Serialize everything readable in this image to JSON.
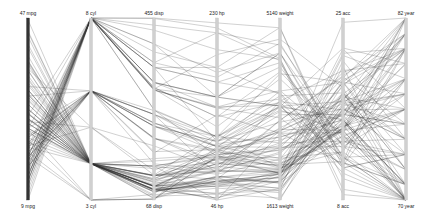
{
  "chart_data": {
    "type": "parallel_coordinates",
    "title": "",
    "axes": [
      {
        "name": "mpg",
        "max": 47,
        "min": 9,
        "top_label": "47 mpg",
        "bottom_label": "9 mpg",
        "x": 28,
        "style": "dark"
      },
      {
        "name": "cyl",
        "max": 8,
        "min": 3,
        "top_label": "8 cyl",
        "bottom_label": "3 cyl",
        "x": 91,
        "style": "light"
      },
      {
        "name": "disp",
        "max": 455,
        "min": 68,
        "top_label": "455 disp",
        "bottom_label": "68 disp",
        "x": 154,
        "style": "light"
      },
      {
        "name": "hp",
        "max": 230,
        "min": 46,
        "top_label": "230 hp",
        "bottom_label": "46 hp",
        "x": 217,
        "style": "light"
      },
      {
        "name": "weight",
        "max": 5140,
        "min": 1613,
        "top_label": "5140 weight",
        "bottom_label": "1613 weight",
        "x": 280,
        "style": "light"
      },
      {
        "name": "acc",
        "max": 25,
        "min": 8,
        "top_label": "25 acc",
        "bottom_label": "8 acc",
        "x": 343,
        "style": "light"
      },
      {
        "name": "year",
        "max": 82,
        "min": 70,
        "top_label": "82 year",
        "bottom_label": "70 year",
        "x": 406,
        "style": "light"
      }
    ],
    "plot_area": {
      "top": 18,
      "bottom": 200
    },
    "colors": {
      "line": "#333333",
      "axis_dark": "#333333",
      "axis_light": "#d0d0d0",
      "background": "#ffffff"
    },
    "records": [
      [
        18,
        8,
        307,
        130,
        3504,
        12,
        70
      ],
      [
        15,
        8,
        350,
        165,
        3693,
        11.5,
        70
      ],
      [
        18,
        8,
        318,
        150,
        3436,
        11,
        70
      ],
      [
        16,
        8,
        304,
        150,
        3433,
        12,
        70
      ],
      [
        17,
        8,
        302,
        140,
        3449,
        10.5,
        70
      ],
      [
        15,
        8,
        429,
        198,
        4341,
        10,
        70
      ],
      [
        14,
        8,
        454,
        220,
        4354,
        9,
        70
      ],
      [
        14,
        8,
        440,
        215,
        4312,
        8.5,
        70
      ],
      [
        24,
        4,
        113,
        95,
        2372,
        15,
        70
      ],
      [
        22,
        6,
        198,
        95,
        2833,
        15.5,
        70
      ],
      [
        18,
        6,
        199,
        97,
        2774,
        15.5,
        70
      ],
      [
        21,
        6,
        200,
        85,
        2587,
        16,
        70
      ],
      [
        27,
        4,
        97,
        88,
        2130,
        14.5,
        70
      ],
      [
        26,
        4,
        97,
        46,
        1835,
        20.5,
        70
      ],
      [
        25,
        4,
        110,
        87,
        2672,
        17.5,
        70
      ],
      [
        24,
        4,
        107,
        90,
        2430,
        14.5,
        70
      ],
      [
        28,
        4,
        140,
        90,
        2264,
        15.5,
        71
      ],
      [
        25,
        4,
        113,
        95,
        2228,
        14,
        71
      ],
      [
        19,
        6,
        232,
        100,
        2634,
        13,
        71
      ],
      [
        16,
        6,
        225,
        105,
        3439,
        15.5,
        71
      ],
      [
        17,
        6,
        250,
        100,
        3329,
        15.5,
        71
      ],
      [
        14,
        8,
        400,
        175,
        4464,
        11.5,
        71
      ],
      [
        13,
        8,
        350,
        165,
        4274,
        12,
        71
      ],
      [
        27,
        4,
        101,
        83,
        2202,
        15.3,
        71
      ],
      [
        22,
        4,
        140,
        72,
        2408,
        19,
        72
      ],
      [
        21,
        4,
        120,
        76,
        2511,
        18,
        72
      ],
      [
        12,
        8,
        455,
        225,
        4951,
        11,
        73
      ],
      [
        13,
        8,
        360,
        170,
        4654,
        13,
        73
      ],
      [
        20,
        4,
        97,
        88,
        2279,
        19,
        73
      ],
      [
        26,
        4,
        96,
        69,
        2189,
        18,
        72
      ],
      [
        16,
        6,
        258,
        110,
        3632,
        18,
        74
      ],
      [
        29,
        4,
        98,
        83,
        2219,
        16.5,
        74
      ],
      [
        32,
        4,
        71,
        65,
        1836,
        21,
        74
      ],
      [
        31,
        4,
        76,
        52,
        1649,
        16.5,
        74
      ],
      [
        19,
        6,
        225,
        95,
        3264,
        16,
        75
      ],
      [
        18,
        6,
        171,
        97,
        2984,
        14.5,
        75
      ],
      [
        29,
        4,
        90,
        70,
        1937,
        14,
        76
      ],
      [
        24,
        4,
        98,
        60,
        2164,
        22.1,
        76
      ],
      [
        15.5,
        8,
        304,
        120,
        3962,
        13.9,
        76
      ],
      [
        30,
        4,
        111,
        80,
        2155,
        14.8,
        77
      ],
      [
        20.5,
        6,
        225,
        100,
        3430,
        17.2,
        78
      ],
      [
        19.4,
        8,
        318,
        140,
        3735,
        13.2,
        78
      ],
      [
        30.5,
        4,
        98,
        63,
        2051,
        17,
        77
      ],
      [
        43.1,
        4,
        90,
        48,
        1985,
        21.5,
        78
      ],
      [
        36.1,
        4,
        91,
        60,
        1800,
        16.4,
        78
      ],
      [
        18.1,
        8,
        302,
        139,
        3205,
        11.2,
        78
      ],
      [
        20.2,
        8,
        302,
        139,
        3570,
        12.8,
        78
      ],
      [
        17.5,
        6,
        250,
        110,
        3520,
        16.4,
        77
      ],
      [
        27.2,
        4,
        119,
        97,
        2300,
        14.7,
        78
      ],
      [
        25.4,
        5,
        183,
        77,
        3530,
        20.1,
        79
      ],
      [
        37.3,
        4,
        91,
        69,
        2130,
        14.7,
        79
      ],
      [
        20.3,
        5,
        131,
        103,
        2830,
        15.9,
        78
      ],
      [
        23.9,
        8,
        260,
        90,
        3420,
        22.2,
        79
      ],
      [
        34.1,
        4,
        86,
        65,
        1975,
        15.2,
        79
      ],
      [
        46.6,
        4,
        86,
        65,
        2110,
        17.9,
        80
      ],
      [
        44.3,
        4,
        90,
        48,
        2085,
        21.7,
        80
      ],
      [
        32.7,
        6,
        168,
        132,
        2910,
        11.4,
        80
      ],
      [
        36.4,
        5,
        121,
        67,
        2950,
        19.9,
        80
      ],
      [
        29.8,
        4,
        89,
        62,
        1845,
        15.3,
        80
      ],
      [
        23.6,
        4,
        140,
        0,
        2905,
        14.3,
        80
      ],
      [
        31.3,
        4,
        120,
        75,
        2542,
        17.5,
        80
      ],
      [
        38.1,
        4,
        89,
        60,
        1968,
        18.8,
        80
      ],
      [
        34.4,
        4,
        98,
        65,
        2045,
        16.2,
        81
      ],
      [
        22.4,
        6,
        231,
        110,
        3415,
        15.8,
        81
      ],
      [
        26.6,
        8,
        350,
        105,
        3725,
        19,
        81
      ],
      [
        30.7,
        6,
        145,
        76,
        3160,
        19.6,
        81
      ],
      [
        37.7,
        4,
        89,
        62,
        2050,
        17.3,
        81
      ],
      [
        25.8,
        4,
        156,
        92,
        2620,
        14.4,
        81
      ],
      [
        27,
        4,
        151,
        90,
        2950,
        17.3,
        82
      ],
      [
        38,
        4,
        105,
        63,
        2125,
        14.7,
        82
      ],
      [
        32,
        4,
        91,
        67,
        1965,
        15.7,
        82
      ],
      [
        44,
        4,
        97,
        52,
        2130,
        24.6,
        82
      ],
      [
        32,
        4,
        135,
        84,
        2295,
        11.6,
        82
      ],
      [
        28,
        4,
        120,
        79,
        2625,
        18.6,
        82
      ],
      [
        31,
        4,
        119,
        82,
        2720,
        19.4,
        82
      ],
      [
        36,
        4,
        107,
        75,
        2205,
        14.5,
        82
      ],
      [
        11,
        8,
        350,
        180,
        3664,
        11,
        73
      ],
      [
        10,
        8,
        360,
        215,
        4615,
        14,
        70
      ],
      [
        9,
        8,
        304,
        193,
        4732,
        18.5,
        70
      ],
      [
        13,
        8,
        400,
        150,
        4464,
        12,
        73
      ],
      [
        35,
        4,
        72,
        69,
        1613,
        18,
        71
      ],
      [
        33,
        4,
        91,
        53,
        1795,
        17.5,
        74
      ],
      [
        28,
        4,
        97,
        75,
        2155,
        16.4,
        76
      ],
      [
        15,
        6,
        250,
        72,
        3158,
        19.5,
        75
      ],
      [
        16,
        8,
        318,
        150,
        4190,
        13,
        76
      ],
      [
        17,
        8,
        260,
        110,
        4060,
        19,
        77
      ],
      [
        24,
        6,
        200,
        81,
        3012,
        17.6,
        76
      ],
      [
        19,
        3,
        70,
        90,
        2330,
        13.5,
        72
      ],
      [
        18,
        3,
        70,
        90,
        2124,
        13.5,
        73
      ],
      [
        23.7,
        3,
        70,
        100,
        2420,
        12.5,
        80
      ],
      [
        21.5,
        3,
        80,
        110,
        2720,
        13.5,
        77
      ],
      [
        40.8,
        4,
        85,
        65,
        2110,
        19.2,
        80
      ],
      [
        33.5,
        4,
        85,
        70,
        1945,
        16.8,
        77
      ],
      [
        41.5,
        4,
        98,
        76,
        2144,
        14.7,
        80
      ],
      [
        39.1,
        4,
        79,
        58,
        1755,
        16.9,
        81
      ],
      [
        14,
        8,
        318,
        150,
        4457,
        13.5,
        74
      ],
      [
        25,
        4,
        140,
        92,
        2572,
        14.9,
        76
      ],
      [
        23,
        4,
        120,
        88,
        2957,
        17,
        75
      ],
      [
        26,
        4,
        121,
        113,
        2234,
        12.5,
        70
      ],
      [
        20,
        6,
        232,
        100,
        2914,
        16,
        75
      ],
      [
        18,
        6,
        225,
        105,
        3121,
        16.5,
        73
      ],
      [
        12,
        8,
        383,
        180,
        4955,
        11.5,
        71
      ],
      [
        13,
        8,
        307,
        130,
        4098,
        14,
        72
      ],
      [
        22,
        6,
        250,
        105,
        3353,
        14.5,
        76
      ]
    ]
  }
}
